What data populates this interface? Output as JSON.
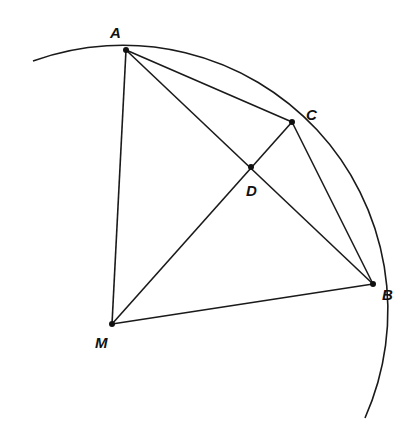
{
  "diagram": {
    "type": "geometry",
    "stroke_color": "#1a1a1a",
    "circle": {
      "center": [
        110,
        314
      ],
      "radius": 265,
      "arc_start": [
        33,
        61
      ],
      "arc_end": [
        365,
        418
      ]
    },
    "points": {
      "A": {
        "label": "A",
        "x": 126,
        "y": 50,
        "label_x": 110,
        "label_y": 38
      },
      "C": {
        "label": "C",
        "x": 292,
        "y": 122,
        "label_x": 306,
        "label_y": 120
      },
      "D": {
        "label": "D",
        "x": 251,
        "y": 167,
        "label_x": 246,
        "label_y": 196
      },
      "B": {
        "label": "B",
        "x": 373,
        "y": 284,
        "label_x": 382,
        "label_y": 300
      },
      "M": {
        "label": "M",
        "x": 112,
        "y": 324,
        "label_x": 95,
        "label_y": 348
      }
    },
    "segments": [
      "AM",
      "AC",
      "AB",
      "MC",
      "CB",
      "MB"
    ]
  }
}
